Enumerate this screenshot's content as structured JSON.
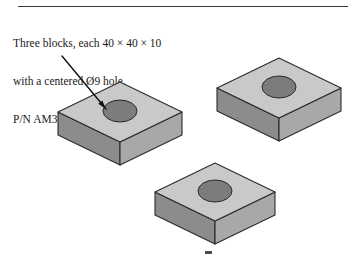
{
  "page": {
    "width": 353,
    "height": 266,
    "background": "#ffffff"
  },
  "divider": {
    "name": "top-horizontal-rule",
    "color": "#3a3a3a"
  },
  "caption": {
    "line1": "Three blocks, each 40 × 40 × 10",
    "line2": "with a centered Ø9 hole.",
    "line3": "P/N AM311-10M",
    "text_color": "#1a1a1a"
  },
  "leader": {
    "name": "leader-line",
    "color": "#111111",
    "start_x": 62,
    "start_y": 56,
    "end_x": 106,
    "end_y": 109
  },
  "marks": {
    "bottom_smudge_color": "#4b4b55"
  },
  "colors": {
    "top_face": "#c9c9c9",
    "left_face": "#8c8c8c",
    "right_face": "#a8a8a8",
    "hole_fill": "#7c7c7c",
    "outline": "#2b2b2b"
  },
  "blocks": [
    {
      "id": "block-left",
      "label": "Block 1 (left)",
      "top_center_x": 120,
      "top_center_y": 112,
      "half_width": 62,
      "half_depth": 30,
      "thickness": 23,
      "hole_center_x": 120,
      "hole_center_y": 111,
      "hole_rx": 17,
      "hole_ry": 11
    },
    {
      "id": "block-right",
      "label": "Block 2 (upper right)",
      "top_center_x": 279,
      "top_center_y": 88,
      "half_width": 62,
      "half_depth": 30,
      "thickness": 23,
      "hole_center_x": 279,
      "hole_center_y": 87,
      "hole_rx": 17,
      "hole_ry": 11
    },
    {
      "id": "block-center",
      "label": "Block 3 (lower center)",
      "top_center_x": 215,
      "top_center_y": 192,
      "half_width": 60,
      "half_depth": 29,
      "thickness": 23,
      "hole_center_x": 215,
      "hole_center_y": 191,
      "hole_rx": 17,
      "hole_ry": 11
    }
  ],
  "drawing": {
    "name": "isometric-blocks-illustration",
    "description": "Three isometric rectangular blocks each with a centered through hole"
  }
}
